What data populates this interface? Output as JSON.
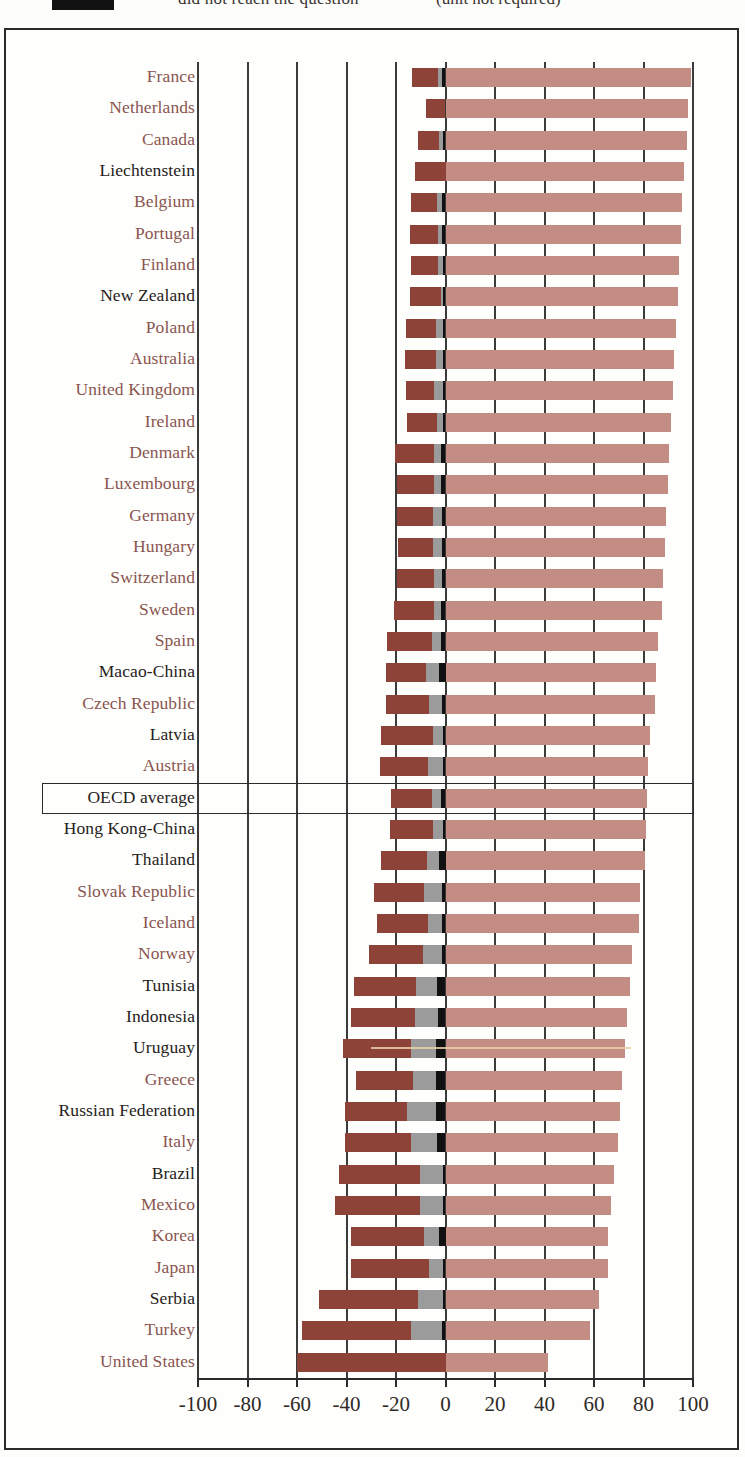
{
  "legend": {
    "swatch_color": "#111111",
    "left_label": "did not reach the question",
    "right_label": "(unit not required)"
  },
  "axis": {
    "ticks": [
      -100,
      -80,
      -60,
      -40,
      -20,
      0,
      20,
      40,
      60,
      80,
      100
    ],
    "tick_labels": [
      "-100",
      "-80",
      "-60",
      "-40",
      "-20",
      "0",
      "20",
      "40",
      "60",
      "80",
      "100"
    ],
    "min": -100,
    "max": 100
  },
  "colors": {
    "dark_brown": "#8d4338",
    "gray": "#9b9b9b",
    "black": "#111111",
    "rose": "#c48d84",
    "label_red": "#8a5550",
    "label_black": "#262220"
  },
  "highlight_row": "OECD average",
  "chart_data": {
    "type": "bar",
    "orientation": "horizontal",
    "stacked": true,
    "title": "",
    "xlabel": "",
    "ylabel": "",
    "xlim": [
      -100,
      100
    ],
    "grid": true,
    "legend_position": "top",
    "series": [
      {
        "name": "dark-brown-negative",
        "color": "#8d4338"
      },
      {
        "name": "gray-negative",
        "color": "#9b9b9b"
      },
      {
        "name": "black-negative",
        "color": "#111111"
      },
      {
        "name": "rose-positive",
        "color": "#c48d84"
      }
    ],
    "categories": [
      "France",
      "Netherlands",
      "Canada",
      "Liechtenstein",
      "Belgium",
      "Portugal",
      "Finland",
      "New Zealand",
      "Poland",
      "Australia",
      "United Kingdom",
      "Ireland",
      "Denmark",
      "Luxembourg",
      "Germany",
      "Hungary",
      "Switzerland",
      "Sweden",
      "Spain",
      "Macao-China",
      "Czech Republic",
      "Latvia",
      "Austria",
      "OECD average",
      "Hong Kong-China",
      "Thailand",
      "Slovak Republic",
      "Iceland",
      "Norway",
      "Tunisia",
      "Indonesia",
      "Uruguay",
      "Greece",
      "Russian Federation",
      "Italy",
      "Brazil",
      "Mexico",
      "Korea",
      "Japan",
      "Serbia",
      "Turkey",
      "United States"
    ],
    "label_colors": [
      "red",
      "red",
      "red",
      "black",
      "red",
      "red",
      "red",
      "black",
      "red",
      "red",
      "red",
      "red",
      "red",
      "red",
      "red",
      "red",
      "red",
      "red",
      "red",
      "black",
      "red",
      "black",
      "red",
      "black",
      "black",
      "black",
      "red",
      "red",
      "red",
      "black",
      "black",
      "black",
      "red",
      "black",
      "red",
      "black",
      "red",
      "red",
      "red",
      "black",
      "red",
      "red"
    ],
    "rows": [
      {
        "category": "France",
        "dark": -10.5,
        "gray": -1.5,
        "black": -1.5,
        "rose": 99.0
      },
      {
        "category": "Netherlands",
        "dark": -8.0,
        "gray": 0.0,
        "black": 0.0,
        "rose": 98.0
      },
      {
        "category": "Canada",
        "dark": -8.5,
        "gray": -1.5,
        "black": -1.0,
        "rose": 97.5
      },
      {
        "category": "Liechtenstein",
        "dark": -12.5,
        "gray": 0.0,
        "black": 0.0,
        "rose": 96.5
      },
      {
        "category": "Belgium",
        "dark": -10.5,
        "gray": -2.0,
        "black": -1.5,
        "rose": 95.5
      },
      {
        "category": "Portugal",
        "dark": -11.5,
        "gray": -1.5,
        "black": -1.5,
        "rose": 95.0
      },
      {
        "category": "Finland",
        "dark": -11.0,
        "gray": -2.0,
        "black": -1.0,
        "rose": 94.5
      },
      {
        "category": "New Zealand",
        "dark": -12.5,
        "gray": -1.0,
        "black": -1.0,
        "rose": 94.0
      },
      {
        "category": "Poland",
        "dark": -12.0,
        "gray": -3.0,
        "black": -1.0,
        "rose": 93.0
      },
      {
        "category": "Australia",
        "dark": -12.5,
        "gray": -3.0,
        "black": -1.0,
        "rose": 92.5
      },
      {
        "category": "United Kingdom",
        "dark": -11.5,
        "gray": -3.5,
        "black": -1.0,
        "rose": 92.0
      },
      {
        "category": "Ireland",
        "dark": -12.0,
        "gray": -2.5,
        "black": -1.0,
        "rose": 91.0
      },
      {
        "category": "Denmark",
        "dark": -16.0,
        "gray": -2.5,
        "black": -2.0,
        "rose": 90.5
      },
      {
        "category": "Luxembourg",
        "dark": -15.0,
        "gray": -2.5,
        "black": -2.0,
        "rose": 90.0
      },
      {
        "category": "Germany",
        "dark": -14.5,
        "gray": -3.5,
        "black": -1.5,
        "rose": 89.0
      },
      {
        "category": "Hungary",
        "dark": -14.0,
        "gray": -3.5,
        "black": -1.5,
        "rose": 88.5
      },
      {
        "category": "Switzerland",
        "dark": -15.0,
        "gray": -3.0,
        "black": -1.5,
        "rose": 88.0
      },
      {
        "category": "Sweden",
        "dark": -16.5,
        "gray": -2.5,
        "black": -2.0,
        "rose": 87.5
      },
      {
        "category": "Spain",
        "dark": -18.0,
        "gray": -3.5,
        "black": -2.0,
        "rose": 86.0
      },
      {
        "category": "Macao-China",
        "dark": -16.0,
        "gray": -5.5,
        "black": -2.5,
        "rose": 85.0
      },
      {
        "category": "Czech Republic",
        "dark": -17.5,
        "gray": -5.0,
        "black": -1.5,
        "rose": 84.5
      },
      {
        "category": "Latvia",
        "dark": -21.0,
        "gray": -4.0,
        "black": -1.0,
        "rose": 82.5
      },
      {
        "category": "Austria",
        "dark": -19.5,
        "gray": -6.0,
        "black": -1.0,
        "rose": 82.0
      },
      {
        "category": "OECD average",
        "dark": -16.5,
        "gray": -3.5,
        "black": -2.0,
        "rose": 81.5
      },
      {
        "category": "Hong Kong-China",
        "dark": -17.5,
        "gray": -4.0,
        "black": -1.0,
        "rose": 81.0
      },
      {
        "category": "Thailand",
        "dark": -18.5,
        "gray": -5.0,
        "black": -2.5,
        "rose": 80.5
      },
      {
        "category": "Slovak Republic",
        "dark": -20.5,
        "gray": -7.0,
        "black": -1.5,
        "rose": 78.5
      },
      {
        "category": "Iceland",
        "dark": -20.5,
        "gray": -5.5,
        "black": -1.5,
        "rose": 78.0
      },
      {
        "category": "Norway",
        "dark": -22.0,
        "gray": -7.5,
        "black": -1.5,
        "rose": 75.5
      },
      {
        "category": "Tunisia",
        "dark": -25.0,
        "gray": -8.5,
        "black": -3.5,
        "rose": 74.5
      },
      {
        "category": "Indonesia",
        "dark": -25.5,
        "gray": -9.5,
        "black": -3.0,
        "rose": 73.5
      },
      {
        "category": "Uruguay",
        "dark": -27.5,
        "gray": -10.0,
        "black": -4.0,
        "rose": 72.5
      },
      {
        "category": "Greece",
        "dark": -23.0,
        "gray": -9.0,
        "black": -4.0,
        "rose": 71.5
      },
      {
        "category": "Russian Federation",
        "dark": -25.0,
        "gray": -11.5,
        "black": -4.0,
        "rose": 70.5
      },
      {
        "category": "Italy",
        "dark": -26.5,
        "gray": -10.5,
        "black": -3.5,
        "rose": 69.5
      },
      {
        "category": "Brazil",
        "dark": -32.5,
        "gray": -9.5,
        "black": -1.0,
        "rose": 68.0
      },
      {
        "category": "Mexico",
        "dark": -34.0,
        "gray": -9.5,
        "black": -1.0,
        "rose": 67.0
      },
      {
        "category": "Korea",
        "dark": -29.5,
        "gray": -6.0,
        "black": -2.5,
        "rose": 65.5
      },
      {
        "category": "Japan",
        "dark": -31.5,
        "gray": -5.5,
        "black": -1.0,
        "rose": 65.5
      },
      {
        "category": "Serbia",
        "dark": -40.0,
        "gray": -10.0,
        "black": -1.0,
        "rose": 62.0
      },
      {
        "category": "Turkey",
        "dark": -44.0,
        "gray": -12.5,
        "black": -1.5,
        "rose": 58.5
      },
      {
        "category": "United States",
        "dark": -60.0,
        "gray": 0.0,
        "black": 0.0,
        "rose": 41.5
      }
    ]
  }
}
